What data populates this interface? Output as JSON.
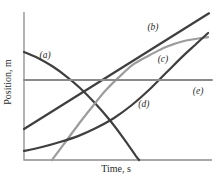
{
  "chart_data": {
    "type": "line",
    "title": "",
    "xlabel": "Time, s",
    "ylabel": "Position, m",
    "axes": {
      "color": "#8c8c8c",
      "stroke_width": 1.3,
      "x_ticks": [],
      "y_ticks": [],
      "grid": "off",
      "note": "unlabeled qualitative axes; x and y values below are normalized 0-1 fractions of the plotted axis ranges"
    },
    "legend": "none",
    "label_color": "#2a2a2a",
    "series": [
      {
        "name": "a",
        "label": "(a)",
        "kind": "concave-down decreasing curve",
        "color": "#3f3f3f",
        "width": 2.2,
        "smooth": true,
        "points": [
          [
            0,
            0.74
          ],
          [
            0.074,
            0.699
          ],
          [
            0.149,
            0.644
          ],
          [
            0.223,
            0.575
          ],
          [
            0.298,
            0.493
          ],
          [
            0.372,
            0.397
          ],
          [
            0.447,
            0.288
          ],
          [
            0.521,
            0.164
          ],
          [
            0.596,
            0.027
          ],
          [
            0.612,
            0
          ]
        ],
        "label_anchor": [
          0.112,
          0.719
        ]
      },
      {
        "name": "b",
        "label": "(b)",
        "kind": "straight line, constant positive slope",
        "color": "#3f3f3f",
        "width": 2.2,
        "smooth": false,
        "points": [
          [
            0,
            0.212
          ],
          [
            0.984,
            1.005
          ]
        ],
        "label_anchor": [
          0.686,
          0.911
        ]
      },
      {
        "name": "c",
        "label": "(c)",
        "kind": "concave-down increasing curve, levels off",
        "color": "#9c9c9c",
        "width": 2.2,
        "smooth": true,
        "points": [
          [
            0.149,
            0
          ],
          [
            0.213,
            0.11
          ],
          [
            0.287,
            0.24
          ],
          [
            0.362,
            0.363
          ],
          [
            0.436,
            0.479
          ],
          [
            0.511,
            0.575
          ],
          [
            0.585,
            0.658
          ],
          [
            0.67,
            0.719
          ],
          [
            0.755,
            0.774
          ],
          [
            0.851,
            0.815
          ],
          [
            0.979,
            0.842
          ]
        ],
        "label_anchor": [
          0.739,
          0.692
        ]
      },
      {
        "name": "d",
        "label": "(d)",
        "kind": "concave-up increasing curve",
        "color": "#3f3f3f",
        "width": 2.2,
        "smooth": true,
        "points": [
          [
            0,
            0.062
          ],
          [
            0.096,
            0.089
          ],
          [
            0.191,
            0.123
          ],
          [
            0.287,
            0.164
          ],
          [
            0.383,
            0.219
          ],
          [
            0.479,
            0.288
          ],
          [
            0.574,
            0.377
          ],
          [
            0.67,
            0.486
          ],
          [
            0.755,
            0.596
          ],
          [
            0.84,
            0.705
          ],
          [
            0.91,
            0.788
          ],
          [
            0.979,
            0.87
          ]
        ],
        "label_anchor": [
          0.638,
          0.384
        ]
      },
      {
        "name": "e",
        "label": "(e)",
        "kind": "horizontal line, constant position",
        "color": "#8a8a8a",
        "width": 1.9,
        "smooth": false,
        "points": [
          [
            0,
            0.548
          ],
          [
            1,
            0.548
          ]
        ],
        "label_anchor": [
          0.926,
          0.473
        ]
      }
    ]
  }
}
